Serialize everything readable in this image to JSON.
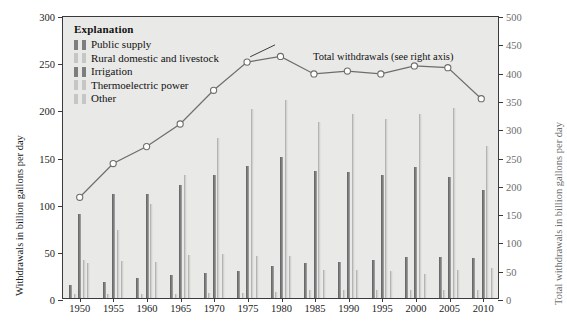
{
  "legend": {
    "title": "Explanation",
    "items": [
      {
        "label": "Public supply",
        "tone": "dark"
      },
      {
        "label": "Rural domestic and livestock",
        "tone": "light"
      },
      {
        "label": "Irrigation",
        "tone": "dark"
      },
      {
        "label": "Thermoelectric power",
        "tone": "light"
      },
      {
        "label": "Other",
        "tone": "light"
      }
    ]
  },
  "annotation": "Total withdrawals (see right axis)",
  "colors": {
    "bar_dark": "#7e7e7e",
    "bar_light": "#d2d2d0",
    "plot_background": "#e9e9e7",
    "frame": "#3a3a3a",
    "line": "#6d6d6d",
    "right_axis_text": "#6d6d6d"
  },
  "chart_data": {
    "type": "bar",
    "title": "",
    "xlabel": "",
    "ylabel": "Withdrawals in billion gallons per day",
    "y2label": "Total withdrawals in billion gallons per day",
    "ylim": [
      0,
      300
    ],
    "y2lim": [
      0,
      500
    ],
    "yticks": [
      0,
      50,
      100,
      150,
      200,
      250,
      300
    ],
    "y2ticks": [
      0,
      50,
      100,
      150,
      200,
      250,
      300,
      350,
      400,
      450,
      500
    ],
    "grid": false,
    "legend_position": "upper-left",
    "categories": [
      1950,
      1955,
      1960,
      1965,
      1970,
      1975,
      1980,
      1985,
      1990,
      1995,
      2000,
      2005,
      2010
    ],
    "series": [
      {
        "name": "Public supply",
        "axis": "left",
        "tone": "dark",
        "values": [
          14,
          17,
          21,
          24,
          27,
          29,
          34,
          37,
          38,
          40,
          43,
          44,
          42
        ]
      },
      {
        "name": "Rural domestic and livestock",
        "axis": "left",
        "tone": "light",
        "values": [
          4,
          4,
          4,
          4,
          5,
          5,
          6,
          8,
          8,
          9,
          9,
          9,
          9
        ]
      },
      {
        "name": "Irrigation",
        "axis": "left",
        "tone": "dark",
        "values": [
          89,
          110,
          110,
          120,
          130,
          140,
          150,
          135,
          134,
          130,
          139,
          128,
          115
        ]
      },
      {
        "name": "Thermoelectric power",
        "axis": "left",
        "tone": "light",
        "values": [
          40,
          72,
          100,
          130,
          170,
          200,
          210,
          187,
          195,
          190,
          195,
          201,
          161
        ]
      },
      {
        "name": "Other",
        "axis": "left",
        "tone": "light",
        "values": [
          37,
          39,
          38,
          46,
          47,
          45,
          45,
          30,
          30,
          29,
          25,
          30,
          32
        ]
      }
    ],
    "line_series": {
      "name": "Total withdrawals",
      "axis": "right",
      "marker": "open-circle",
      "values": [
        180,
        240,
        270,
        310,
        370,
        420,
        430,
        399,
        404,
        399,
        413,
        410,
        355
      ]
    }
  }
}
